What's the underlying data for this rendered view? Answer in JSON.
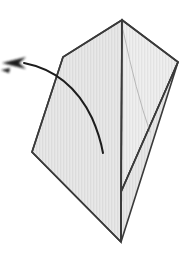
{
  "figure": {
    "title": "Origami fold step diagram",
    "caption": "",
    "canvas": {
      "width": 192,
      "height": 258,
      "background": "#ffffff"
    },
    "palette": {
      "paper_fill": "#e2e2e2",
      "paper_fill_light": "#ebebeb",
      "outline": "#3a3a3a",
      "crease_faint": "#b8b8b8",
      "arrow": "#1d1d1d",
      "background": "#ffffff"
    },
    "vertices": {
      "apex_top": [
        122,
        20
      ],
      "flap_left": [
        63,
        57
      ],
      "right_corner": [
        178,
        62
      ],
      "left_corner": [
        32,
        152
      ],
      "bottom_point": [
        121,
        242
      ],
      "vertical_mid_junction": [
        121,
        192
      ]
    },
    "shapes": {
      "left_panel_points": "122,20 63,57 32,152 121,242",
      "right_panel_points": "122,20 178,62 121,192",
      "lower_right_panel_points": "121,192 121,242 178,62",
      "center_crease_path": "M 122 20 L 121 242",
      "left_edge_path": "M 122 20 L 63 57 L 32 152 L 121 242",
      "right_edge_path": "M 122 20 L 178 62 L 121 192",
      "faint_crease_path": "M 123 30 Q 136 92 150 132"
    },
    "fold_arrow": {
      "label": "fold direction arrow",
      "curve_path": "M 24 63 Q 70 72 92 118 Q 100 136 103 153",
      "head_points": "26,57 2,63 26,69 19,63",
      "head_tail_points": "10,68 1,70 9,73",
      "direction": "right-to-left",
      "tail_tip": [
        103,
        153
      ],
      "head_tip": [
        1,
        63
      ]
    }
  }
}
